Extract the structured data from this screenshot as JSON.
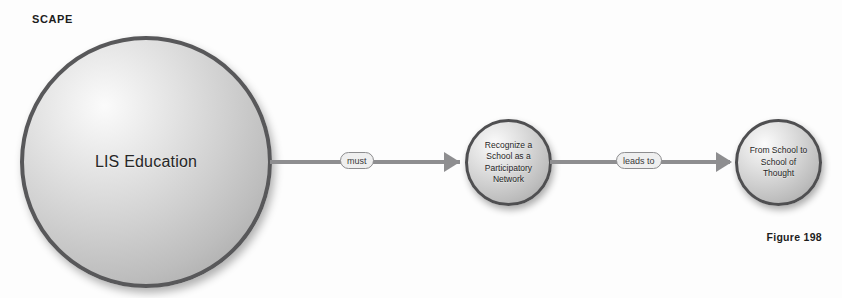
{
  "page": {
    "section_label": "SCAPE",
    "figure_caption": "Figure 198",
    "background_color": "#fdfdfd"
  },
  "diagram": {
    "type": "flow-diagram",
    "nodes": [
      {
        "id": "lis-education",
        "label": "LIS Education",
        "shape": "sphere",
        "size": "large",
        "fill": "#cfcfcf",
        "border_color": "#58585a"
      },
      {
        "id": "participatory-network",
        "label": "Recognize a\nSchool as a\nParticipatory\nNetwork",
        "shape": "sphere",
        "size": "small",
        "fill": "#cfcfcf",
        "border_color": "#4f4f51"
      },
      {
        "id": "school-of-thought",
        "label": "From School to\nSchool of\nThought",
        "shape": "sphere",
        "size": "small",
        "fill": "#cfcfcf",
        "border_color": "#4f4f51"
      }
    ],
    "edges": [
      {
        "id": "edge-must",
        "label": "must",
        "from": "lis-education",
        "to": "participatory-network",
        "color": "#8e8e90"
      },
      {
        "id": "edge-leads-to",
        "label": "leads to",
        "from": "participatory-network",
        "to": "school-of-thought",
        "color": "#8e8e90"
      }
    ]
  }
}
